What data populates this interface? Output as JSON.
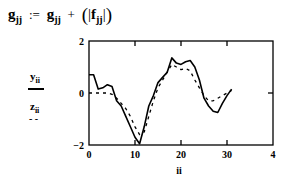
{
  "formula": {
    "lhs_var": "g",
    "lhs_sub": "jj",
    "assign": ":=",
    "rhs_var": "g",
    "rhs_sub": "jj",
    "plus": "+",
    "abs_var": "f",
    "abs_sub": "jj"
  },
  "legend": {
    "y_var": "y",
    "y_sub": "ii",
    "z_var": "z",
    "z_sub": "ii",
    "z_style": "- -"
  },
  "chart_data": {
    "type": "line",
    "title": "",
    "xlabel": "ii",
    "ylabel": "y_ii, z_ii",
    "xlim": [
      0,
      40
    ],
    "ylim": [
      -2,
      2
    ],
    "x_ticks": [
      "0",
      "10",
      "20",
      "30",
      "4"
    ],
    "y_ticks": [
      "2",
      "0",
      "-2"
    ],
    "grid": false,
    "x": [
      0,
      1,
      2,
      3,
      4,
      5,
      6,
      7,
      8,
      9,
      10,
      11,
      12,
      13,
      14,
      15,
      16,
      17,
      18,
      19,
      20,
      21,
      22,
      23,
      24,
      25,
      26,
      27,
      28,
      29,
      30,
      31
    ],
    "series": [
      {
        "name": "y_ii",
        "style": "solid",
        "values": [
          0.7,
          0.7,
          0.15,
          0.2,
          0.32,
          0.25,
          -0.3,
          -0.5,
          -0.9,
          -1.3,
          -1.7,
          -1.95,
          -1.3,
          -0.5,
          -0.1,
          0.4,
          0.6,
          0.8,
          1.35,
          1.15,
          1.1,
          1.2,
          1.25,
          1.0,
          0.5,
          -0.2,
          -0.5,
          -0.7,
          -0.75,
          -0.4,
          -0.1,
          0.15
        ]
      },
      {
        "name": "z_ii",
        "style": "dashed",
        "values": [
          0,
          0,
          0,
          0,
          0,
          -0.05,
          -0.2,
          -0.4,
          -0.6,
          -0.9,
          -1.3,
          -1.6,
          -1.5,
          -0.9,
          -0.3,
          0.2,
          0.5,
          0.8,
          1.1,
          1.0,
          0.9,
          0.95,
          0.85,
          0.5,
          0.2,
          -0.1,
          -0.3,
          -0.3,
          -0.2,
          -0.1,
          0.0,
          0.1
        ]
      }
    ]
  }
}
